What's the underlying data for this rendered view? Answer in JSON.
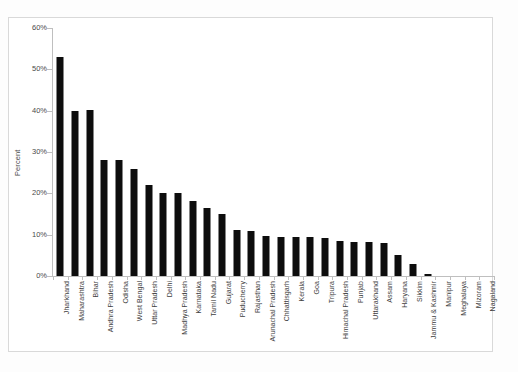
{
  "figure": {
    "background_color": "#ffffff",
    "frame_border_color": "#d9d9d9",
    "bar_color": "#0d0d0d",
    "axis_color": "#bfbfbf",
    "text_color": "#3d3d3d"
  },
  "axis": {
    "y_title": "Percent",
    "y_ticks": [
      "60%",
      "50%",
      "40%",
      "30%",
      "20%",
      "10%",
      "0%"
    ]
  },
  "chart_data": {
    "type": "bar",
    "title": "",
    "subtitle": "",
    "xlabel": "",
    "ylabel": "Percent",
    "ylim": [
      0,
      60
    ],
    "ytick_values": [
      0,
      10,
      20,
      30,
      40,
      50,
      60
    ],
    "ytick_labels": [
      "0%",
      "10%",
      "20%",
      "30%",
      "40%",
      "50%",
      "60%"
    ],
    "grid": false,
    "legend": false,
    "legend_position": "none",
    "orientation": "vertical",
    "value_unit": "percent",
    "sorted": "descending",
    "categories": [
      "Jharkhand",
      "Maharashtra",
      "Bihar",
      "Andhra Pradesh",
      "Odisha",
      "West Bengal",
      "Uttar Pradesh",
      "Delhi",
      "Madhya Pradesh",
      "Karnataka",
      "Tamil Nadu",
      "Gujarat",
      "Puducherry",
      "Rajasthan",
      "Arunachal Pradesh",
      "Chhattisgarh",
      "Kerala",
      "Goa",
      "Tripura",
      "Himachal Pradesh",
      "Punjab",
      "Uttarakhand",
      "Assam",
      "Haryana",
      "Sikkim",
      "Jammu & Kashmir",
      "Manipur",
      "Meghalaya",
      "Mizoram",
      "Nagaland"
    ],
    "values": [
      53.0,
      40.0,
      40.2,
      28.0,
      28.0,
      26.0,
      22.0,
      20.2,
      20.0,
      18.2,
      16.5,
      15.0,
      11.2,
      11.0,
      9.6,
      9.5,
      9.5,
      9.5,
      9.3,
      8.5,
      8.3,
      8.2,
      8.0,
      5.0,
      3.0,
      0.4,
      0.0,
      0.0,
      0.0,
      0.0
    ]
  }
}
